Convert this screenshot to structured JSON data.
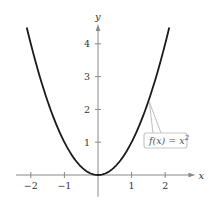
{
  "chart_data": {
    "type": "line",
    "title": "",
    "xlabel": "x",
    "ylabel": "y",
    "xlim": [
      -2.5,
      2.9
    ],
    "ylim": [
      -0.6,
      4.6
    ],
    "x_ticks": [
      -2,
      -1,
      1,
      2
    ],
    "x_tick_labels": [
      "−2",
      "−1",
      "1",
      "2"
    ],
    "y_ticks": [
      1,
      2,
      3,
      4
    ],
    "y_tick_labels": [
      "1",
      "2",
      "3",
      "4"
    ],
    "grid": false,
    "series": [
      {
        "name": "f(x) = x^2",
        "function": "x^2",
        "x_range": [
          -2.12,
          2.12
        ],
        "x": [
          -2.12,
          -2,
          -1.5,
          -1,
          -0.5,
          0,
          0.5,
          1,
          1.5,
          2,
          2.12
        ],
        "y": [
          4.49,
          4,
          2.25,
          1,
          0.25,
          0,
          0.25,
          1,
          2.25,
          4,
          4.49
        ],
        "color": "#1a1a1a"
      }
    ],
    "annotations": [
      {
        "text_main": "f(x) = x",
        "superscript": "2",
        "points_to_x": 1.5,
        "box_color": "#c8c8c8"
      }
    ]
  }
}
